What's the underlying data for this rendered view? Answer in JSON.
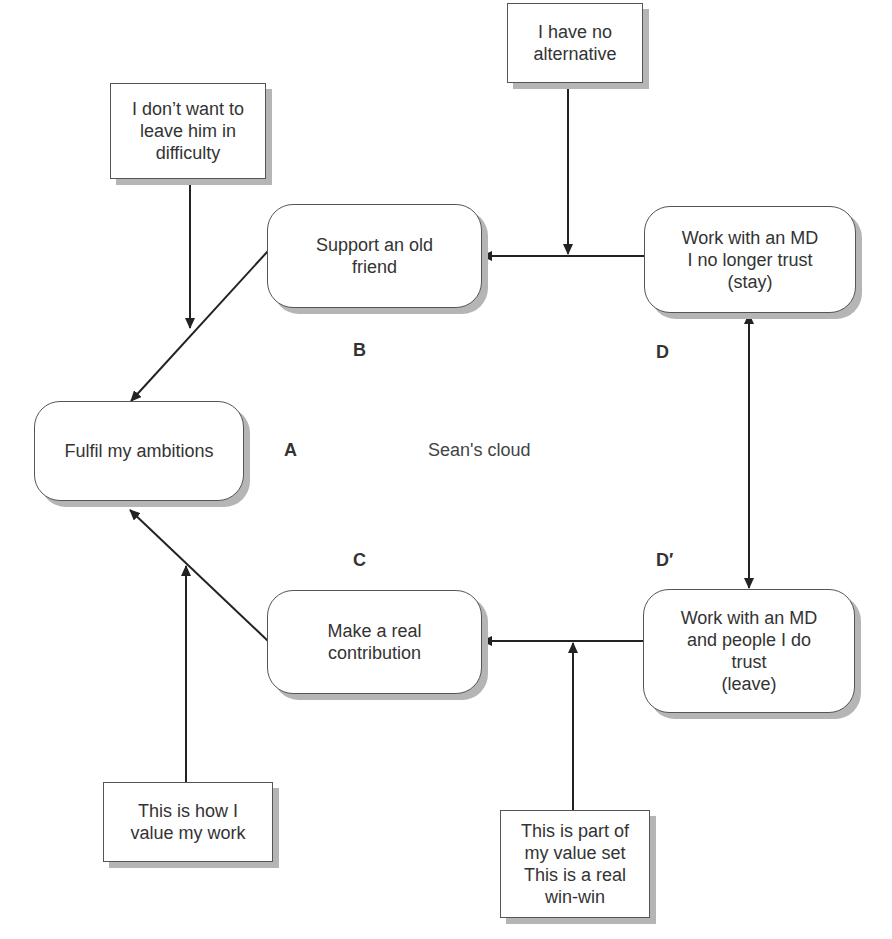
{
  "diagram": {
    "title": "Sean's cloud",
    "nodes": {
      "A": {
        "label": "Fulfil my ambitions",
        "letter": "A"
      },
      "B": {
        "label": "Support an old\nfriend",
        "letter": "B"
      },
      "C": {
        "label": "Make a real\ncontribution",
        "letter": "C"
      },
      "D": {
        "label": "Work with an MD\nI no longer trust\n(stay)",
        "letter": "D"
      },
      "D_prime": {
        "label": "Work with an MD\nand people I do\ntrust\n(leave)",
        "letter": "D′"
      }
    },
    "assumptions": {
      "AB": "I don’t want to\nleave him in\ndifficulty",
      "BD": "I have no\nalternative",
      "AC": "This is how I\nvalue my work",
      "CD_prime": "This is part of\nmy value set\nThis is a real\nwin-win"
    },
    "edges": [
      {
        "from": "B",
        "to": "A"
      },
      {
        "from": "C",
        "to": "A"
      },
      {
        "from": "D",
        "to": "B"
      },
      {
        "from": "D_prime",
        "to": "C"
      },
      {
        "from": "D",
        "to": "D_prime",
        "bidirectional": true
      }
    ],
    "colors": {
      "line": "#222222",
      "border": "#555555",
      "shadow": "#b5b5b5"
    }
  }
}
